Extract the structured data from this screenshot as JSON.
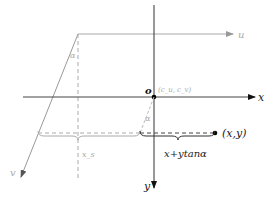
{
  "diagram": {
    "axes": {
      "x_label": "x",
      "y_label": "y",
      "u_label": "u",
      "v_label": "v",
      "origin_label": "o",
      "center_label": "(c_u, c_v)"
    },
    "angles": {
      "alpha_top": "α",
      "alpha_bottom": "α"
    },
    "annotations": {
      "point_label": "(x,y)",
      "offset_label": "x+ytanα",
      "xs_label": "x_s"
    },
    "colors": {
      "main_axis": "#111111",
      "aux_axis": "#aaaaaa",
      "dashed": "#999999"
    }
  }
}
